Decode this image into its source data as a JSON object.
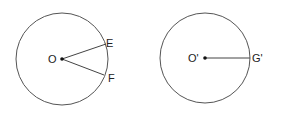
{
  "diagram": {
    "circle_left": {
      "center_label": "O",
      "points": [
        {
          "label": "E"
        },
        {
          "label": "F"
        }
      ]
    },
    "circle_right": {
      "center_label": "O'",
      "points": [
        {
          "label": "G'"
        }
      ]
    },
    "colors": {
      "stroke": "#555555",
      "text": "#222222"
    }
  }
}
